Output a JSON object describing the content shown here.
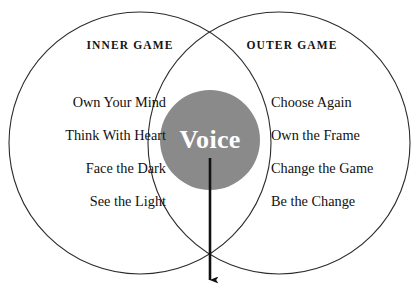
{
  "diagram": {
    "type": "venn",
    "colors": {
      "circle_stroke": "#2b2b2b",
      "background": "#ffffff",
      "center_fill": "#8a8a8a",
      "center_text": "#ffffff",
      "text": "#111111",
      "arrow": "#111111"
    },
    "left_set": {
      "title": "INNER GAME",
      "items": [
        "Own Your Mind",
        "Think With Heart",
        "Face the Dark",
        "See the Light"
      ]
    },
    "right_set": {
      "title": "OUTER GAME",
      "items": [
        "Choose Again",
        "Own the Frame",
        "Change the Game",
        "Be the Change"
      ]
    },
    "intersection": {
      "label": "Voice"
    },
    "arrow": {
      "name": "downward-arrow",
      "direction": "down"
    }
  }
}
